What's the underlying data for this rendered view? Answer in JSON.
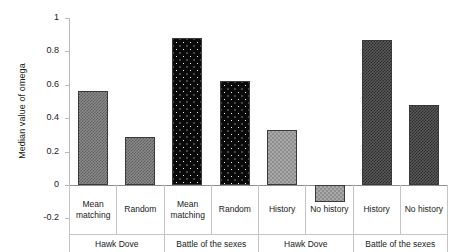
{
  "chart_data": {
    "type": "bar",
    "title": "",
    "xlabel": "",
    "ylabel": "Median value of omega",
    "ylim": [
      -0.2,
      1
    ],
    "ytick_labels": [
      "1",
      "0.8",
      "0.6",
      "0.4",
      "0.2",
      "0",
      "-0.2"
    ],
    "ytick_values": [
      1,
      0.8,
      0.6,
      0.4,
      0.2,
      0,
      -0.2
    ],
    "grid": false,
    "legend": "none",
    "categories": [
      "Mean matching",
      "Random",
      "Mean matching",
      "Random",
      "History",
      "No history",
      "History",
      "No history"
    ],
    "values": [
      0.56,
      0.29,
      0.88,
      0.62,
      0.33,
      -0.1,
      0.87,
      0.48
    ],
    "bar_patterns": [
      "checker-grey",
      "checker-grey",
      "dots-black",
      "dots-black",
      "checker-light",
      "checker-light",
      "checker-dark",
      "checker-dark"
    ],
    "groups": [
      "Hawk Dove",
      "Battle of the sexes",
      "Hawk Dove",
      "Battle of the sexes"
    ]
  },
  "axis": {
    "y_title": "Median value of omega",
    "ticks": [
      {
        "label": "1",
        "value": 1
      },
      {
        "label": "0.8",
        "value": 0.8
      },
      {
        "label": "0.6",
        "value": 0.6
      },
      {
        "label": "0.4",
        "value": 0.4
      },
      {
        "label": "0.2",
        "value": 0.2
      },
      {
        "label": "0",
        "value": 0
      },
      {
        "label": "-0.2",
        "value": -0.2
      }
    ]
  },
  "categories": [
    {
      "label": "Mean matching"
    },
    {
      "label": "Random"
    },
    {
      "label": "Mean matching"
    },
    {
      "label": "Random"
    },
    {
      "label": "History"
    },
    {
      "label": "No history"
    },
    {
      "label": "History"
    },
    {
      "label": "No history"
    }
  ],
  "groups": [
    {
      "label": "Hawk Dove"
    },
    {
      "label": "Battle of the sexes"
    },
    {
      "label": "Hawk Dove"
    },
    {
      "label": "Battle of the sexes"
    }
  ],
  "colors": {
    "axis": "#b9b9b9",
    "zero_line": "#8d8d8d",
    "grid_border": "#c4c4c4",
    "bar_outline": "#3a3a3a",
    "text": "#1a1a1a",
    "background": "#ffffff"
  }
}
